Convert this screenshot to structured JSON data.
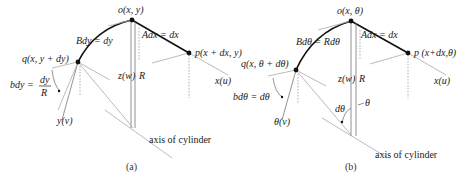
{
  "panels": [
    {
      "caption": "(a)",
      "point_o": "o(x, y)",
      "point_p": "p(x + dx, y)",
      "point_q": "q(x, y + dy)",
      "arc_label": "Bdy = dy",
      "line_label": "Adx = dx",
      "z_axis": "z(w)",
      "radius": "R",
      "x_axis": "x(u)",
      "y_axis": "y(v)",
      "angle_label_left": "bdy =",
      "angle_label_num": "dy",
      "angle_label_den": "R",
      "axis_label": "axis of cylinder"
    },
    {
      "caption": "(b)",
      "point_o": "o(x, θ)",
      "point_p": "p (x+dx,θ)",
      "point_q": "q(x, θ + dθ)",
      "arc_label": "Bdθ = Rdθ",
      "line_label": "Adx = dx",
      "z_axis": "z(w)",
      "radius": "R",
      "x_axis": "x(u)",
      "y_axis": "θ(v)",
      "angle_label": "bdθ = dθ",
      "angle_dtheta": "dθ",
      "angle_theta": "θ",
      "axis_label": "axis of cylinder"
    }
  ]
}
